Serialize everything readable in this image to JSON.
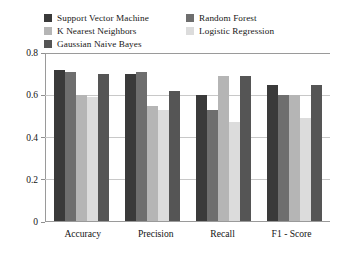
{
  "chart_data": {
    "type": "bar",
    "title": "",
    "subtitle": "",
    "xlabel": "",
    "ylabel": "",
    "categories": [
      "Accuracy",
      "Precision",
      "Recall",
      "F1 - Score"
    ],
    "series": [
      {
        "name": "Support Vector Machine",
        "color": "#3a3a3a",
        "values": [
          0.72,
          0.7,
          0.6,
          0.65
        ]
      },
      {
        "name": "Random Forest",
        "color": "#6e6e6e",
        "values": [
          0.71,
          0.71,
          0.53,
          0.6
        ]
      },
      {
        "name": "K Nearest Neighbors",
        "color": "#b5b5b5",
        "values": [
          0.6,
          0.55,
          0.69,
          0.6
        ]
      },
      {
        "name": "Logistic Regression",
        "color": "#dcdcdc",
        "values": [
          0.59,
          0.53,
          0.47,
          0.49
        ]
      },
      {
        "name": "Gaussian Naive Bayes",
        "color": "#555555",
        "values": [
          0.7,
          0.62,
          0.69,
          0.65
        ]
      }
    ],
    "ylim": [
      0,
      0.8
    ],
    "yticks": [
      0,
      0.2,
      0.4,
      0.6,
      0.8
    ],
    "ytick_labels": [
      "0",
      "0.2",
      "0.4",
      "0.6",
      "0.8"
    ],
    "grid": true,
    "grid_axis": "y",
    "legend_position": "top",
    "legend_columns": 2
  },
  "legend": {
    "entries": [
      {
        "label": "Support Vector Machine"
      },
      {
        "label": "K Nearest Neighbors"
      },
      {
        "label": "Gaussian Naive Bayes"
      },
      {
        "label": "Random Forest"
      },
      {
        "label": "Logistic Regression"
      }
    ]
  }
}
